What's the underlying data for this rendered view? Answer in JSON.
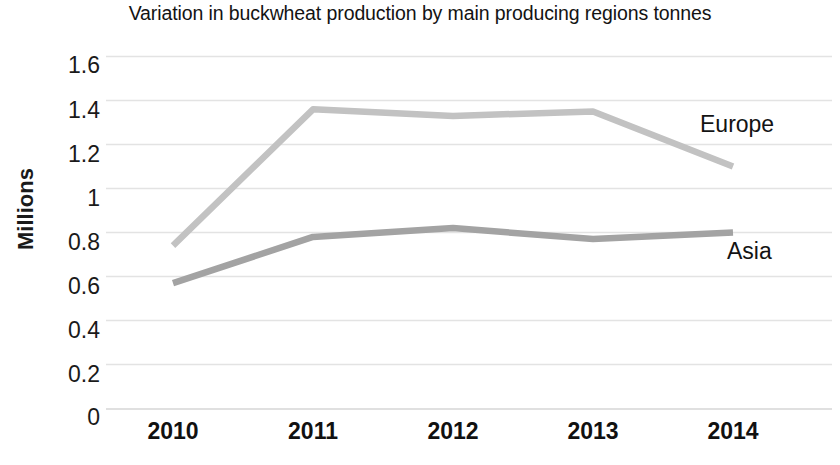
{
  "chart_data": {
    "type": "line",
    "title": "Variation in buckwheat production by main producing regions tonnes",
    "xlabel": "",
    "ylabel": "Millions",
    "categories": [
      "2010",
      "2011",
      "2012",
      "2013",
      "2014"
    ],
    "x": [
      2010,
      2011,
      2012,
      2013,
      2014
    ],
    "ylim": [
      0,
      1.6
    ],
    "y_ticks": [
      "0",
      "0.2",
      "0.4",
      "0.6",
      "0.8",
      "1",
      "1.2",
      "1.4",
      "1.6"
    ],
    "y_tick_values": [
      0,
      0.2,
      0.4,
      0.6,
      0.8,
      1.0,
      1.2,
      1.4,
      1.6
    ],
    "grid": true,
    "grid_axis": "y",
    "legend_position": "inline-right-of-line-end",
    "series": [
      {
        "name": "Europe",
        "color": "#c2c2c2",
        "values": [
          0.74,
          1.36,
          1.33,
          1.35,
          1.1
        ]
      },
      {
        "name": "Asia",
        "color": "#a3a3a3",
        "values": [
          0.57,
          0.78,
          0.82,
          0.77,
          0.8
        ]
      }
    ]
  },
  "labels": {
    "series_europe": "Europe",
    "series_asia": "Asia"
  },
  "colors": {
    "europe_line": "#c2c2c2",
    "asia_line": "#a3a3a3",
    "gridline": "#e3e3e3",
    "text": "#1a1a1a",
    "background": "#ffffff"
  }
}
